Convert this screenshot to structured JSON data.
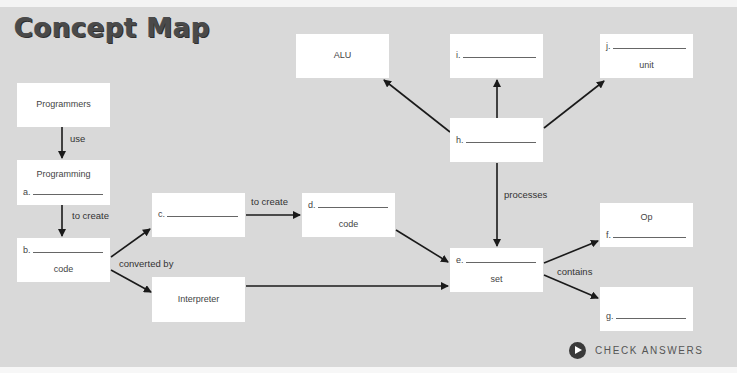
{
  "title": "Concept Map",
  "nodes": {
    "programmers": {
      "text": "Programmers"
    },
    "programming": {
      "text": "Programming",
      "blank_label": "a."
    },
    "b_code": {
      "blank_label": "b.",
      "text": "code"
    },
    "c": {
      "blank_label": "c."
    },
    "interpreter": {
      "text": "Interpreter"
    },
    "d_code": {
      "blank_label": "d.",
      "text": "code"
    },
    "e_set": {
      "blank_label": "e.",
      "text": "set"
    },
    "alu": {
      "text": "ALU"
    },
    "i": {
      "blank_label": "i."
    },
    "h": {
      "blank_label": "h."
    },
    "j_unit": {
      "blank_label": "j.",
      "text": "unit"
    },
    "op_f": {
      "text": "Op",
      "blank_label": "f."
    },
    "g": {
      "blank_label": "g."
    }
  },
  "edge_labels": {
    "use": "use",
    "to_create_1": "to create",
    "to_create_2": "to create",
    "converted_by": "converted by",
    "processes": "processes",
    "contains": "contains"
  },
  "check_answers": {
    "label": "CHECK ANSWERS",
    "icon": "play-circle-icon"
  },
  "colors": {
    "background": "#d9d9d9",
    "box": "#ffffff",
    "arrow": "#1a1a1a",
    "title": "#4a4a4a"
  }
}
